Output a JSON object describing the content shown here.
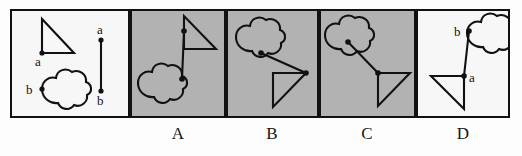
{
  "figure": {
    "kind": "visual-analogy-matrix-puzzle",
    "frame_border_color": "#111111",
    "page_background": "#ffffff",
    "panel_background_white": "#f7f7f7",
    "panel_background_gray": "#b2b2b2",
    "stroke_color": "#111111",
    "point_labels": {
      "a": "a",
      "b": "b"
    },
    "panels": [
      {
        "id": "prompt",
        "name": "prompt-panel",
        "label": "",
        "background": "white",
        "shapes": [
          "triangle",
          "cloud",
          "line-segment"
        ],
        "point_a_label": "a",
        "point_b_label": "b",
        "segment_top_label": "a",
        "segment_bottom_label": "b"
      },
      {
        "id": "A",
        "name": "option-panel-a",
        "label": "A",
        "background": "gray",
        "shapes": [
          "cloud",
          "triangle",
          "connector"
        ]
      },
      {
        "id": "B",
        "name": "option-panel-b",
        "label": "B",
        "background": "gray",
        "shapes": [
          "cloud",
          "triangle",
          "connector"
        ]
      },
      {
        "id": "C",
        "name": "option-panel-c",
        "label": "C",
        "background": "gray",
        "shapes": [
          "cloud",
          "triangle",
          "connector"
        ]
      },
      {
        "id": "D",
        "name": "option-panel-d",
        "label": "D",
        "background": "white",
        "shapes": [
          "cloud",
          "triangle",
          "connector"
        ],
        "point_a_label": "a",
        "point_b_label": "b"
      }
    ],
    "options": [
      {
        "key": "A",
        "label": "A"
      },
      {
        "key": "B",
        "label": "B"
      },
      {
        "key": "C",
        "label": "C"
      },
      {
        "key": "D",
        "label": "D"
      }
    ]
  }
}
